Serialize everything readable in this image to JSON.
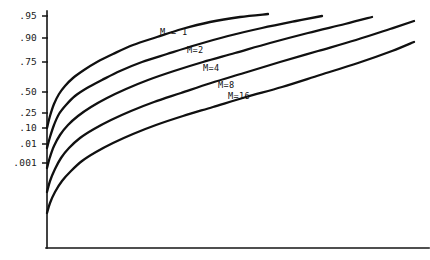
{
  "chart_data": {
    "type": "line",
    "title": "",
    "subtitle": "",
    "xlabel": "",
    "ylabel": "",
    "grid": false,
    "legend_position": "inline-curve-labels",
    "axis": {
      "y_tick_labels": [
        ".95",
        ".90",
        ".75",
        ".50",
        ".25",
        ".10",
        ".01",
        ".001"
      ],
      "y_tick_values": [
        0.95,
        0.9,
        0.75,
        0.5,
        0.25,
        0.1,
        0.01,
        0.001
      ],
      "y_tick_pixel_y": [
        16,
        38,
        62,
        92,
        113,
        128,
        144,
        163
      ],
      "x_axis_visible": true,
      "x_tick_labels": [],
      "y_axis_pixel_x": 47,
      "x_axis_pixel_y": 248,
      "plot_right_pixel_x": 418
    },
    "series": [
      {
        "name": "M = 1",
        "label": "M = 1",
        "label_pixel": [
          160,
          32
        ],
        "points": [
          [
            47,
            128
          ],
          [
            50,
            116
          ],
          [
            54,
            104
          ],
          [
            59,
            94
          ],
          [
            65,
            86
          ],
          [
            73,
            78
          ],
          [
            84,
            70
          ],
          [
            97,
            62
          ],
          [
            113,
            54
          ],
          [
            133,
            45
          ],
          [
            157,
            37
          ],
          [
            182,
            29
          ],
          [
            210,
            22
          ],
          [
            240,
            17
          ],
          [
            268,
            14
          ]
        ]
      },
      {
        "name": "M = 2",
        "label": "M=2",
        "label_pixel": [
          187,
          50
        ],
        "points": [
          [
            47,
            148
          ],
          [
            50,
            137
          ],
          [
            54,
            125
          ],
          [
            59,
            114
          ],
          [
            66,
            105
          ],
          [
            75,
            96
          ],
          [
            87,
            88
          ],
          [
            102,
            80
          ],
          [
            120,
            71
          ],
          [
            142,
            62
          ],
          [
            167,
            54
          ],
          [
            196,
            45
          ],
          [
            228,
            36
          ],
          [
            262,
            28
          ],
          [
            296,
            21
          ],
          [
            322,
            16
          ]
        ]
      },
      {
        "name": "M = 4",
        "label": "M=4",
        "label_pixel": [
          203,
          68
        ],
        "points": [
          [
            47,
            168
          ],
          [
            50,
            157
          ],
          [
            54,
            146
          ],
          [
            60,
            135
          ],
          [
            68,
            125
          ],
          [
            78,
            116
          ],
          [
            91,
            107
          ],
          [
            107,
            98
          ],
          [
            126,
            89
          ],
          [
            148,
            80
          ],
          [
            174,
            71
          ],
          [
            203,
            62
          ],
          [
            235,
            53
          ],
          [
            270,
            43
          ],
          [
            308,
            33
          ],
          [
            345,
            24
          ],
          [
            372,
            17
          ]
        ]
      },
      {
        "name": "M = 8",
        "label": "M=8",
        "label_pixel": [
          218,
          85
        ],
        "points": [
          [
            47,
            192
          ],
          [
            50,
            181
          ],
          [
            55,
            169
          ],
          [
            61,
            158
          ],
          [
            69,
            148
          ],
          [
            80,
            138
          ],
          [
            94,
            129
          ],
          [
            111,
            120
          ],
          [
            131,
            111
          ],
          [
            154,
            102
          ],
          [
            181,
            93
          ],
          [
            211,
            83
          ],
          [
            244,
            73
          ],
          [
            280,
            62
          ],
          [
            318,
            51
          ],
          [
            356,
            40
          ],
          [
            390,
            29
          ],
          [
            414,
            21
          ]
        ]
      },
      {
        "name": "M = 16",
        "label": "M=16",
        "label_pixel": [
          228,
          96
        ],
        "points": [
          [
            47,
            213
          ],
          [
            50,
            203
          ],
          [
            55,
            192
          ],
          [
            62,
            181
          ],
          [
            71,
            171
          ],
          [
            82,
            161
          ],
          [
            96,
            152
          ],
          [
            113,
            143
          ],
          [
            133,
            134
          ],
          [
            156,
            125
          ],
          [
            183,
            116
          ],
          [
            213,
            107
          ],
          [
            246,
            97
          ],
          [
            282,
            87
          ],
          [
            320,
            75
          ],
          [
            358,
            63
          ],
          [
            392,
            51
          ],
          [
            414,
            42
          ]
        ]
      }
    ]
  },
  "style": {
    "background_color": "#ffffff",
    "line_color": "#101010",
    "axis_color": "#141414",
    "text_color": "#1a1a1a"
  }
}
